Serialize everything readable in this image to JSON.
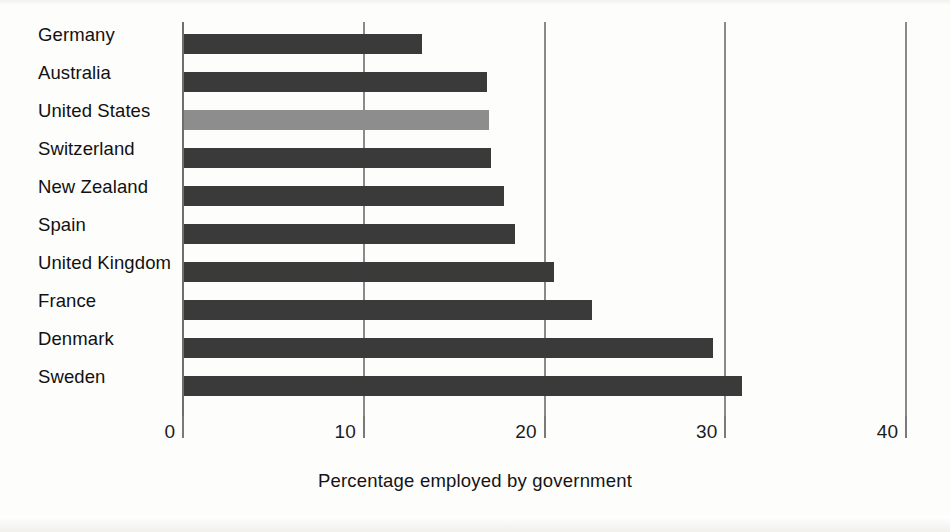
{
  "chart_data": {
    "type": "bar",
    "orientation": "horizontal",
    "title": "",
    "subtitle": "",
    "xlabel": "Percentage employed by government",
    "ylabel": "",
    "xlim": [
      0,
      40
    ],
    "xticks": [
      0,
      10,
      20,
      30,
      40
    ],
    "xtick_labels": [
      "0",
      "10",
      "20",
      "30",
      "40"
    ],
    "grid": true,
    "grid_axis": "x",
    "legend": false,
    "legend_position": "none",
    "categories": [
      "Germany",
      "Australia",
      "United States",
      "Switzerland",
      "New Zealand",
      "Spain",
      "United Kingdom",
      "France",
      "Denmark",
      "Sweden"
    ],
    "values": [
      13.3,
      16.9,
      17.0,
      17.1,
      17.8,
      18.4,
      20.6,
      22.7,
      29.4,
      31.0
    ],
    "highlight_category": "United States",
    "colors": {
      "bar": "#3a3a3a",
      "bar_highlight": "#8d8d8d",
      "axis": "#6e6e6e",
      "gridline": "#8a8a8a",
      "text": "#141414",
      "background": "#fdfdfc"
    }
  }
}
